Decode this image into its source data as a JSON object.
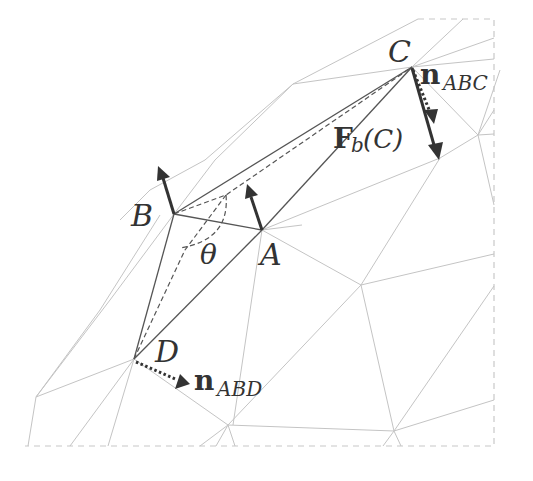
{
  "diagram": {
    "vertices": {
      "A": {
        "label": "A",
        "x": 262,
        "y": 230
      },
      "B": {
        "label": "B",
        "x": 174,
        "y": 214
      },
      "C": {
        "label": "C",
        "x": 412,
        "y": 67
      },
      "D": {
        "label": "D",
        "x": 134,
        "y": 359
      }
    },
    "labels": {
      "A": "A",
      "B": "B",
      "C": "C",
      "D": "D",
      "theta": "θ",
      "n_abc_main": "n",
      "n_abc_sub": "ABC",
      "n_abd_main": "n",
      "n_abd_sub": "ABD",
      "force_main": "F",
      "force_sub": "b",
      "force_arg": "(C)"
    },
    "colors": {
      "mesh": "#c4c4c4",
      "triangle": "#555555",
      "arrow": "#333333"
    }
  }
}
